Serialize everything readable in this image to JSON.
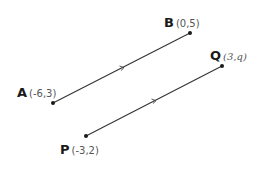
{
  "diagram": {
    "type": "parallel-line-segments",
    "colors": {
      "line": "#333333",
      "point": "#1a1a1a",
      "label": "#1a1a1a",
      "coords": "#555555"
    },
    "points": {
      "A": {
        "name": "A",
        "coords": "(-6,3)",
        "px": [
          53,
          103
        ]
      },
      "B": {
        "name": "B",
        "coords": "(0,5)",
        "px": [
          190,
          33
        ]
      },
      "P": {
        "name": "P",
        "coords": "(-3,2)",
        "px": [
          86,
          136
        ]
      },
      "Q": {
        "name": "Q",
        "coords": "(3,q)",
        "px": [
          222,
          66
        ]
      }
    },
    "segments": [
      {
        "name": "AB",
        "from": "A",
        "to": "B",
        "arrow_mark": true
      },
      {
        "name": "PQ",
        "from": "P",
        "to": "Q",
        "arrow_mark": true
      }
    ]
  }
}
